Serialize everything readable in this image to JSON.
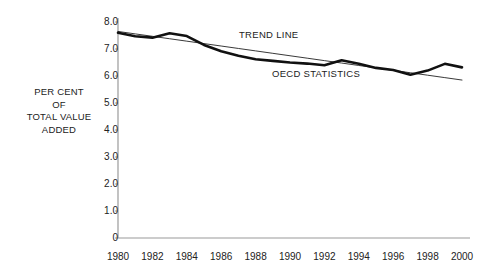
{
  "axis_label": {
    "lines": [
      "PER CENT",
      "OF",
      "TOTAL VALUE",
      "ADDED"
    ],
    "text": "PER CENT\nOF\nTOTAL VALUE\nADDED"
  },
  "annotations": {
    "trend": "TREND LINE",
    "oecd": "OECD STATISTICS"
  },
  "chart_data": {
    "type": "line",
    "title": "",
    "subtitle": "",
    "xlabel": "",
    "ylabel": "PER CENT OF TOTAL VALUE ADDED",
    "xlim": [
      1980,
      2000
    ],
    "ylim": [
      0,
      8.0
    ],
    "grid": false,
    "legend_position": "inline-annotation",
    "yticks": [
      "0",
      "1.0",
      "2.0",
      "3.0",
      "4.0",
      "5.0",
      "6.0",
      "7.0",
      "8.0"
    ],
    "ytick_values": [
      0,
      1.0,
      2.0,
      3.0,
      4.0,
      5.0,
      6.0,
      7.0,
      8.0
    ],
    "xticks": [
      "1980",
      "1982",
      "1984",
      "1986",
      "1988",
      "1990",
      "1992",
      "1994",
      "1996",
      "1998",
      "2000"
    ],
    "xtick_values": [
      1980,
      1982,
      1984,
      1986,
      1988,
      1990,
      1992,
      1994,
      1996,
      1998,
      2000
    ],
    "x": [
      1980,
      1981,
      1982,
      1983,
      1984,
      1985,
      1986,
      1987,
      1988,
      1989,
      1990,
      1991,
      1992,
      1993,
      1994,
      1995,
      1996,
      1997,
      1998,
      1999,
      2000
    ],
    "series": [
      {
        "name": "OECD STATISTICS",
        "style": "thick",
        "color": "#111111",
        "values": [
          7.6,
          7.47,
          7.42,
          7.58,
          7.48,
          7.15,
          6.92,
          6.75,
          6.62,
          6.56,
          6.5,
          6.46,
          6.4,
          6.58,
          6.45,
          6.3,
          6.22,
          6.05,
          6.2,
          6.45,
          6.32
        ]
      },
      {
        "name": "TREND LINE",
        "style": "thin",
        "color": "#222222",
        "values": [
          7.65,
          7.56,
          7.47,
          7.38,
          7.29,
          7.2,
          7.11,
          7.02,
          6.93,
          6.84,
          6.75,
          6.66,
          6.57,
          6.48,
          6.39,
          6.3,
          6.21,
          6.12,
          6.03,
          5.94,
          5.85
        ]
      }
    ]
  },
  "colors": {
    "axis": "#999999",
    "data": "#111111",
    "trend": "#222222",
    "text": "#222222",
    "background": "#ffffff"
  }
}
